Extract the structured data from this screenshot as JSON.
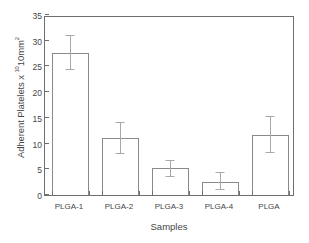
{
  "chart_data": {
    "type": "bar",
    "title": "",
    "subtitle": "",
    "categories": [
      "PLGA-1",
      "PLGA-2",
      "PLGA-3",
      "PLGA-4",
      "PLGA"
    ],
    "values": [
      27.7,
      11.1,
      5.2,
      2.6,
      11.7
    ],
    "errors_upper": [
      31.0,
      14.1,
      6.7,
      4.3,
      15.2
    ],
    "errors_lower": [
      24.3,
      8.0,
      3.6,
      0.9,
      8.1
    ],
    "error_series": [
      {
        "category": "PLGA-1",
        "value": 27.7,
        "upper": 31.0,
        "lower": 24.3
      },
      {
        "category": "PLGA-2",
        "value": 11.1,
        "upper": 14.1,
        "lower": 8.0
      },
      {
        "category": "PLGA-3",
        "value": 5.2,
        "upper": 6.7,
        "lower": 3.6
      },
      {
        "category": "PLGA-4",
        "value": 2.6,
        "upper": 4.3,
        "lower": 0.9
      },
      {
        "category": "PLGA",
        "value": 11.7,
        "upper": 15.2,
        "lower": 8.1
      }
    ],
    "xlabel": "Samples",
    "ylabel_parts": {
      "main": "Adherent Platelets x 10mm",
      "prefix_text": "Adherent Platelets x ",
      "sup_exponent": "10",
      "unit_text": "10mm",
      "sup_unit": "2"
    },
    "ylim": [
      0,
      35
    ],
    "yticks": [
      0,
      5,
      10,
      15,
      20,
      25,
      30,
      35
    ],
    "ytick_labels": [
      "0",
      "5",
      "10",
      "15",
      "20",
      "25",
      "30",
      "35"
    ],
    "grid": false,
    "legend": null,
    "legend_position": "none",
    "bar_fill_color": "#ffffff",
    "bar_edge_color": "#8a8a8a",
    "error_bar_color": "#a8a8a8",
    "axis_color": "#6e6e6e",
    "text_color": "#454545"
  },
  "figure": {
    "background_color": "#ffffff"
  }
}
